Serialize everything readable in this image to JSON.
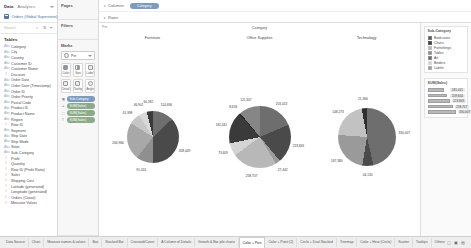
{
  "data_pane": {
    "tab_data": "Data",
    "tab_analytics": "Analytics",
    "source_name": "Orders (Global Superstore)",
    "search_placeholder": "Search",
    "tables_heading": "Tables",
    "fields": [
      {
        "label": "Category",
        "type": "abc"
      },
      {
        "label": "City",
        "type": "abc"
      },
      {
        "label": "Country",
        "type": "abc"
      },
      {
        "label": "Customer ID",
        "type": "abc"
      },
      {
        "label": "Customer Name",
        "type": "abc"
      },
      {
        "label": "Discount",
        "type": "num"
      },
      {
        "label": "Order Date",
        "type": "abc"
      },
      {
        "label": "Order Date (Timestamp)",
        "type": "abc"
      },
      {
        "label": "Order ID",
        "type": "abc"
      },
      {
        "label": "Order Priority",
        "type": "abc"
      },
      {
        "label": "Postal Code",
        "type": "abc"
      },
      {
        "label": "Product ID",
        "type": "abc"
      },
      {
        "label": "Product Name",
        "type": "abc"
      },
      {
        "label": "Region",
        "type": "abc"
      },
      {
        "label": "Row ID",
        "type": "num"
      },
      {
        "label": "Segment",
        "type": "abc"
      },
      {
        "label": "Ship Date",
        "type": "abc"
      },
      {
        "label": "Ship Mode",
        "type": "abc"
      },
      {
        "label": "State",
        "type": "abc"
      },
      {
        "label": "Sub-Category",
        "type": "abc"
      },
      {
        "label": "Profit",
        "type": "num"
      },
      {
        "label": "Quantity",
        "type": "num"
      },
      {
        "label": "Row ID (Profit Ratio)",
        "type": "num"
      },
      {
        "label": "Sales",
        "type": "num"
      },
      {
        "label": "Shipping Cost",
        "type": "num"
      },
      {
        "label": "Latitude (generated)",
        "type": "num"
      },
      {
        "label": "Longitude (generated)",
        "type": "num"
      },
      {
        "label": "Orders (Count)",
        "type": "num"
      },
      {
        "label": "Measure Values",
        "type": "num"
      }
    ]
  },
  "mid_pane": {
    "pages_title": "Pages",
    "filters_title": "Filters",
    "marks_title": "Marks",
    "mark_type": "Pie",
    "buttons": [
      {
        "label": "Color",
        "icon": "color-swatch-icon"
      },
      {
        "label": "Size",
        "icon": "size-icon"
      },
      {
        "label": "Label",
        "icon": "label-icon"
      },
      {
        "label": "Detail",
        "icon": "detail-icon"
      },
      {
        "label": "Tooltip",
        "icon": "tooltip-icon"
      },
      {
        "label": "Angle",
        "icon": "angle-icon"
      }
    ],
    "pills": [
      {
        "label": "Sub-Category",
        "role": "color"
      },
      {
        "label": "SUM(Sales)",
        "role": "angle"
      },
      {
        "label": "SUM(Sales)",
        "role": "size"
      },
      {
        "label": "SUM(Sales)",
        "role": "label"
      }
    ]
  },
  "shelves": {
    "columns_label": "Columns",
    "rows_label": "Rows",
    "columns_pill": "Category"
  },
  "canvas": {
    "corner_label": "Pie",
    "column_header": "Category"
  },
  "legend": {
    "color_title": "Sub-Category",
    "color_items": [
      {
        "label": "Bookcases",
        "color": "#5a5a5a"
      },
      {
        "label": "Chairs",
        "color": "#3a3a3a"
      },
      {
        "label": "Furnishings",
        "color": "#b4b4b4"
      },
      {
        "label": "Tables",
        "color": "#8c8c8c"
      },
      {
        "label": "Art",
        "color": "#6f6f6f"
      },
      {
        "label": "Binders",
        "color": "#d2d2d2"
      },
      {
        "label": "Labels",
        "color": "#9e9e9e"
      }
    ],
    "size_title": "SUM(Sales)",
    "size_items": [
      {
        "value": "181,441",
        "width": 16
      },
      {
        "value": "209,844",
        "width": 19
      },
      {
        "value": "223,843",
        "width": 22
      },
      {
        "value": "258,707",
        "width": 25
      },
      {
        "value": "330,007",
        "width": 28
      }
    ]
  },
  "chart_data": {
    "type": "pie",
    "title": "Category",
    "charts": [
      {
        "title": "Furniture",
        "slices": [
          {
            "label": "Bookcases",
            "value": 114696,
            "display": "114,696",
            "color": "#6e6e6e"
          },
          {
            "label": "Chairs",
            "value": 328449,
            "display": "328,449",
            "color": "#4a4a4a"
          },
          {
            "label": "Furnishings",
            "value": 91024,
            "display": "91,024",
            "color": "#8f8f8f"
          },
          {
            "label": "Tables",
            "value": 206966,
            "display": "206,966",
            "color": "#a8a8a8"
          },
          {
            "label": "Storage",
            "value": 61398,
            "display": "61,398",
            "color": "#c6c6c6"
          },
          {
            "label": "Supplies",
            "value": 46901,
            "display": "46,901",
            "color": "#d8d8d8"
          },
          {
            "label": "Appliances",
            "value": 34282,
            "display": "34,282",
            "color": "#3a3a3a"
          }
        ]
      },
      {
        "title": "Office Supplies",
        "slices": [
          {
            "label": "Binders",
            "value": 203413,
            "display": "203,413",
            "color": "#6e6e6e"
          },
          {
            "label": "Storage",
            "value": 223843,
            "display": "223,843",
            "color": "#4a4a4a"
          },
          {
            "label": "Art",
            "value": 27442,
            "display": "27,442",
            "color": "#9a9a9a"
          },
          {
            "label": "Paper",
            "value": 258707,
            "display": "258,707",
            "color": "#b8b8b8"
          },
          {
            "label": "Labels",
            "value": 73409,
            "display": "73,409",
            "color": "#d4d4d4"
          },
          {
            "label": "Envelopes",
            "value": 181441,
            "display": "181,441",
            "color": "#3a3a3a"
          },
          {
            "label": "Fasteners",
            "value": 8656,
            "display": "8,656",
            "color": "#2a2a2a"
          },
          {
            "label": "Supplies",
            "value": 121307,
            "display": "121,307",
            "color": "#868686"
          }
        ]
      },
      {
        "title": "Technology",
        "slices": [
          {
            "label": "Phones",
            "value": 330007,
            "display": "330,007",
            "color": "#6e6e6e"
          },
          {
            "label": "Machines",
            "value": 44130,
            "display": "44,130",
            "color": "#4a4a4a"
          },
          {
            "label": "Accessories",
            "value": 167380,
            "display": "167,380",
            "color": "#9a9a9a"
          },
          {
            "label": "Copiers",
            "value": 148273,
            "display": "148,273",
            "color": "#c2c2c2"
          },
          {
            "label": "Supplies",
            "value": 21366,
            "display": "21,366",
            "color": "#2e2e2e"
          }
        ]
      }
    ]
  },
  "tabs": {
    "items": [
      "Data Source",
      "Chart",
      "Measure names & values",
      "Box",
      "Stacked Bar",
      "Crosstab/Cover",
      "A Column of Details",
      "Growth & Bar pile chartz",
      "Color + Pies",
      "Color + Point (2)",
      "Circle + Dual Stacked",
      "Treemap",
      "Color + Heat (Circle)",
      "Scatter",
      "Tooltips",
      "Others"
    ],
    "active": "Color + Pies",
    "status_text": "8 marks"
  }
}
